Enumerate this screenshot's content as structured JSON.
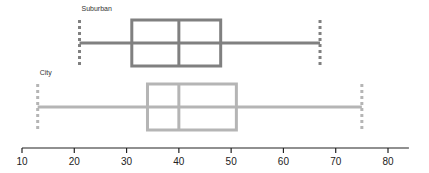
{
  "chart_data": {
    "type": "boxplot",
    "orientation": "horizontal",
    "title": "",
    "xlabel": "",
    "ylabel": "",
    "xlim": [
      10,
      84
    ],
    "xticks": [
      10,
      20,
      30,
      40,
      50,
      60,
      70,
      80
    ],
    "xtick_labels": [
      "10",
      "20",
      "30",
      "40",
      "50",
      "60",
      "70",
      "80"
    ],
    "grid": false,
    "legend": "none",
    "series": [
      {
        "name": "Suburban",
        "color": "#808080",
        "min": 21,
        "q1": 31,
        "median": 40,
        "q3": 48,
        "max": 67
      },
      {
        "name": "City",
        "color": "#b5b5b5",
        "min": 13,
        "q1": 34,
        "median": 40,
        "q3": 51,
        "max": 75
      }
    ]
  }
}
